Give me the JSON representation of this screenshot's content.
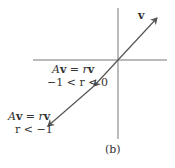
{
  "diagram": {
    "caption": "(b)",
    "vector_label": "v",
    "label_mid": {
      "eq_A": "A",
      "eq_v": "v",
      "eq_mid": " = ",
      "eq_r": "r",
      "eq_v2": "v",
      "cond": "−1 < r < 0"
    },
    "label_low": {
      "eq_A": "A",
      "eq_v": "v",
      "eq_mid": " = ",
      "eq_r": "r",
      "eq_v2": "v",
      "cond": "r < −1"
    },
    "colors": {
      "axis": "#666666",
      "vector": "#555555",
      "text": "#333333"
    }
  }
}
